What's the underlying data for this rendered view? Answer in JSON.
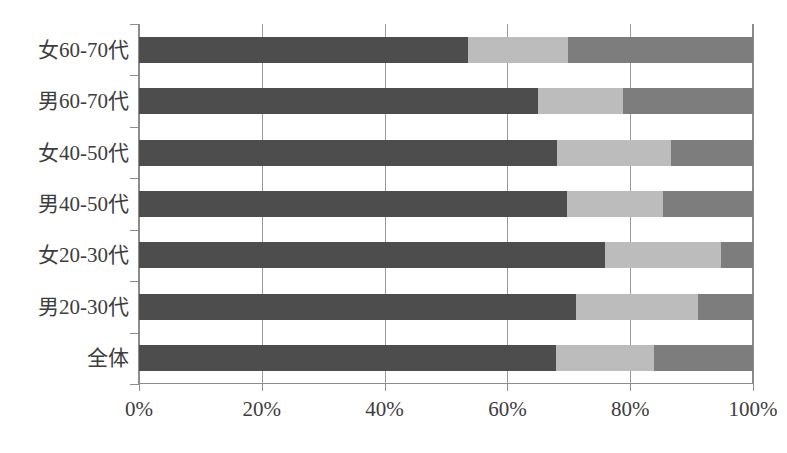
{
  "chart_data": {
    "type": "bar",
    "orientation": "horizontal",
    "stacked": true,
    "normalized": "100%",
    "title": "",
    "xlabel": "",
    "ylabel": "",
    "xlim": [
      0,
      100
    ],
    "grid": true,
    "legend_position": "none",
    "xticks": [
      "0%",
      "20%",
      "40%",
      "60%",
      "80%",
      "100%"
    ],
    "xtick_values": [
      0,
      20,
      40,
      60,
      80,
      100
    ],
    "categories": [
      "女60-70代",
      "男60-70代",
      "女40-50代",
      "男40-50代",
      "女20-30代",
      "男20-30代",
      "全体"
    ],
    "series": [
      {
        "name": "segment-1",
        "color": "#4d4d4d",
        "values": [
          53.6,
          65.0,
          68.1,
          69.7,
          75.9,
          71.2,
          67.9
        ]
      },
      {
        "name": "segment-2",
        "color": "#bcbcbc",
        "values": [
          16.3,
          13.8,
          18.5,
          15.6,
          18.9,
          19.8,
          16.0
        ]
      },
      {
        "name": "segment-3",
        "color": "#7d7d7d",
        "values": [
          30.1,
          21.2,
          13.4,
          14.7,
          5.2,
          9.0,
          16.1
        ]
      }
    ],
    "cumulative_boundaries": [
      [
        53.6,
        69.9
      ],
      [
        65.0,
        78.8
      ],
      [
        68.1,
        86.6
      ],
      [
        69.7,
        85.3
      ],
      [
        75.9,
        94.8
      ],
      [
        71.2,
        91.0
      ],
      [
        67.9,
        83.9
      ]
    ]
  },
  "colors": {
    "segment_1": "#4d4d4d",
    "segment_2": "#bcbcbc",
    "segment_3": "#7d7d7d",
    "axis": "#8c8c8c",
    "grid": "#9a9a9a",
    "text": "#3d3d3d",
    "background": "#ffffff"
  }
}
